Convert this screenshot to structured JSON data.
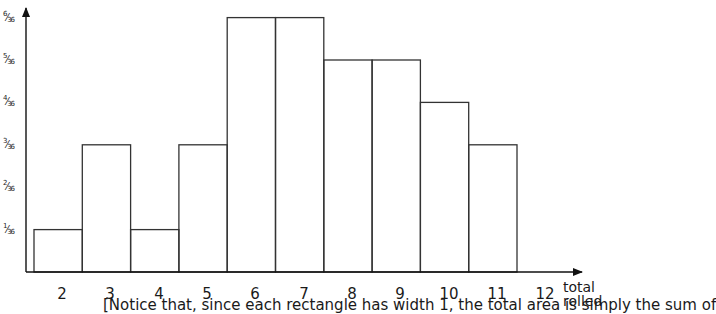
{
  "chart_data": {
    "type": "bar",
    "title": "",
    "xlabel": "total rolled",
    "ylabel": "",
    "categories": [
      "2",
      "3",
      "4",
      "5",
      "6",
      "7",
      "8",
      "9",
      "10",
      "11",
      "12"
    ],
    "values_numerator": [
      1,
      3,
      1,
      3,
      6,
      6,
      5,
      5,
      4,
      3,
      0
    ],
    "values": [
      0.0278,
      0.0833,
      0.0278,
      0.0833,
      0.1667,
      0.1667,
      0.1389,
      0.1389,
      0.1111,
      0.0833,
      0
    ],
    "y_ticks": [
      "1/36",
      "2/36",
      "3/36",
      "4/36",
      "5/36",
      "6/36"
    ],
    "ylim": [
      0,
      0.1667
    ],
    "grid": false,
    "legend": null,
    "note": "histogram with unit-width rectangles, no gaps"
  },
  "y_ticks": [
    {
      "num": "1",
      "den": "36"
    },
    {
      "num": "2",
      "den": "36"
    },
    {
      "num": "3",
      "den": "36"
    },
    {
      "num": "4",
      "den": "36"
    },
    {
      "num": "5",
      "den": "36"
    },
    {
      "num": "6",
      "den": "36"
    }
  ],
  "x_ticks": [
    "2",
    "3",
    "4",
    "5",
    "6",
    "7",
    "8",
    "9",
    "10",
    "11",
    "12"
  ],
  "axis_title_line1": "total",
  "axis_title_line2": "rolled",
  "caption": "[Notice that, since each rectangle has width 1, the total area is simply the sum of"
}
